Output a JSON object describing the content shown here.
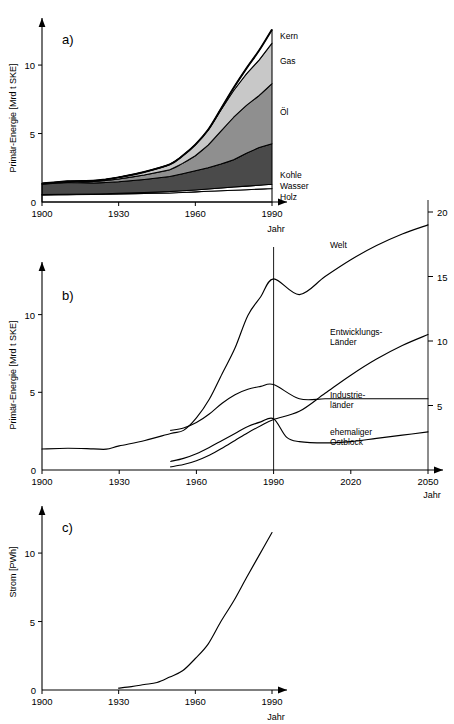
{
  "figure": {
    "width": 454,
    "height": 724,
    "background": "#ffffff",
    "ink": "#000000"
  },
  "panels": [
    {
      "id": "panel-a",
      "letter": "a)",
      "ylabel": "Primär-Energie [Mrd t SKE]",
      "xlabel": "Jahr"
    },
    {
      "id": "panel-b",
      "letter": "b)",
      "ylabel": "Primär-Energie [Mrd t SKE]",
      "xlabel": "Jahr"
    },
    {
      "id": "panel-c",
      "letter": "c)",
      "ylabel": "Strom [PWh]",
      "xlabel": "Jahr"
    }
  ],
  "chart_data": [
    {
      "type": "area",
      "id": "panel-a",
      "title": "a)",
      "subtitle": "Weltweiter Primärenergieverbrauch nach Energieträger",
      "xlabel": "Jahr",
      "ylabel": "Primär-Energie [Mrd t SKE]",
      "stacked": true,
      "grid": false,
      "legend_position": "right-inline",
      "xlim": [
        1900,
        1990
      ],
      "ylim": [
        0,
        13
      ],
      "xticks": [
        1900,
        1930,
        1960,
        1990
      ],
      "yticks": [
        0,
        5,
        10
      ],
      "x": [
        1900,
        1910,
        1920,
        1925,
        1930,
        1940,
        1950,
        1955,
        1960,
        1965,
        1970,
        1975,
        1980,
        1985,
        1990
      ],
      "series": [
        {
          "name": "Holz",
          "label": "Holz",
          "color": "#ffffff",
          "values": [
            0.52,
            0.54,
            0.55,
            0.56,
            0.58,
            0.62,
            0.66,
            0.7,
            0.74,
            0.78,
            0.82,
            0.86,
            0.9,
            0.94,
            0.98
          ]
        },
        {
          "name": "Wasser",
          "label": "Wasser",
          "color": "#ffffff",
          "values": [
            0.02,
            0.03,
            0.04,
            0.05,
            0.06,
            0.08,
            0.1,
            0.12,
            0.14,
            0.17,
            0.2,
            0.23,
            0.26,
            0.29,
            0.32
          ]
        },
        {
          "name": "Kohle",
          "label": "Kohle",
          "color": "#4a4a4a",
          "values": [
            0.76,
            0.85,
            0.8,
            0.82,
            0.84,
            0.95,
            1.1,
            1.25,
            1.4,
            1.55,
            1.75,
            2.0,
            2.4,
            2.75,
            2.95
          ]
        },
        {
          "name": "Öl",
          "label": "Öl",
          "color": "#8f8f8f",
          "values": [
            0.03,
            0.06,
            0.1,
            0.14,
            0.2,
            0.32,
            0.5,
            0.75,
            1.1,
            1.65,
            2.4,
            3.1,
            3.5,
            3.8,
            4.4
          ]
        },
        {
          "name": "Gas",
          "label": "Gas",
          "color": "#c8c8c8",
          "values": [
            0.02,
            0.04,
            0.06,
            0.08,
            0.12,
            0.22,
            0.38,
            0.55,
            0.8,
            1.1,
            1.55,
            1.95,
            2.3,
            2.6,
            2.95
          ]
        },
        {
          "name": "Kern",
          "label": "Kern",
          "color": "#ffffff",
          "values": [
            0.0,
            0.0,
            0.0,
            0.0,
            0.0,
            0.0,
            0.0,
            0.0,
            0.01,
            0.03,
            0.08,
            0.2,
            0.4,
            0.7,
            1.0
          ]
        }
      ]
    },
    {
      "type": "line",
      "id": "panel-b",
      "title": "b)",
      "subtitle": "Primärenergieverbrauch Welt und Regionen mit Prognose bis 2050",
      "xlabel": "Jahr",
      "ylabel": "Primär-Energie [Mrd t SKE]",
      "grid": false,
      "legend_position": "inline-right",
      "xlim": [
        1900,
        2050
      ],
      "ylim_left": [
        0,
        13
      ],
      "ylim_right": [
        0,
        20
      ],
      "xticks": [
        1900,
        1930,
        1960,
        1990,
        2020,
        2050
      ],
      "yticks_left": [
        0,
        5,
        10
      ],
      "yticks_right": [
        5,
        10,
        15,
        20
      ],
      "divider_year": 1990,
      "right_axis_year": 2050,
      "series": [
        {
          "name": "Welt",
          "label": "Welt",
          "x": [
            1900,
            1910,
            1920,
            1925,
            1930,
            1940,
            1950,
            1955,
            1960,
            1965,
            1970,
            1975,
            1980,
            1985,
            1990,
            2000,
            2010,
            2020,
            2030,
            2040,
            2050
          ],
          "values": [
            1.35,
            1.4,
            1.36,
            1.34,
            1.55,
            1.9,
            2.35,
            2.55,
            3.35,
            4.55,
            6.2,
            7.85,
            9.95,
            11.15,
            12.3,
            13.6,
            15.0,
            16.3,
            17.4,
            18.3,
            19.0
          ]
        },
        {
          "name": "Industrie-länder",
          "label": "Industrie-\nländer",
          "x": [
            1950,
            1955,
            1960,
            1965,
            1970,
            1975,
            1980,
            1985,
            1990,
            2000,
            2010,
            2020,
            2030,
            2040,
            2050
          ],
          "values": [
            2.55,
            2.7,
            3.05,
            3.6,
            4.3,
            4.85,
            5.2,
            5.38,
            5.5,
            5.52,
            5.52,
            5.52,
            5.52,
            5.52,
            5.52
          ]
        },
        {
          "name": "Entwicklungs-Länder",
          "label": "Entwicklungs-\nLänder",
          "x": [
            1950,
            1955,
            1960,
            1965,
            1970,
            1975,
            1980,
            1985,
            1990,
            2000,
            2010,
            2020,
            2030,
            2040,
            2050
          ],
          "values": [
            0.2,
            0.35,
            0.6,
            0.95,
            1.4,
            1.9,
            2.4,
            2.85,
            3.25,
            4.55,
            5.95,
            7.35,
            8.6,
            9.65,
            10.5
          ]
        },
        {
          "name": "ehemaliger Ostblock",
          "label": "ehemaliger\nOstblock",
          "x": [
            1950,
            1955,
            1960,
            1965,
            1970,
            1975,
            1980,
            1985,
            1990,
            1995,
            2000,
            2010,
            2020,
            2030,
            2040,
            2050
          ],
          "values": [
            0.55,
            0.75,
            1.05,
            1.45,
            1.9,
            2.35,
            2.8,
            3.1,
            3.3,
            2.55,
            2.2,
            2.1,
            2.2,
            2.45,
            2.7,
            2.95
          ]
        }
      ]
    },
    {
      "type": "line",
      "id": "panel-c",
      "title": "c)",
      "subtitle": "Weltweite Stromerzeugung",
      "xlabel": "Jahr",
      "ylabel": "Strom [PWh]",
      "grid": false,
      "legend_position": "none",
      "xlim": [
        1900,
        1990
      ],
      "ylim": [
        0,
        13
      ],
      "xticks": [
        1900,
        1930,
        1960,
        1990
      ],
      "yticks": [
        0,
        5,
        10
      ],
      "series": [
        {
          "name": "Strom",
          "label": "Strom",
          "x": [
            1930,
            1935,
            1940,
            1945,
            1950,
            1955,
            1960,
            1965,
            1970,
            1975,
            1980,
            1985,
            1990
          ],
          "values": [
            0.14,
            0.25,
            0.4,
            0.55,
            0.95,
            1.4,
            2.3,
            3.35,
            5.0,
            6.5,
            8.2,
            9.85,
            11.5
          ]
        }
      ]
    }
  ]
}
